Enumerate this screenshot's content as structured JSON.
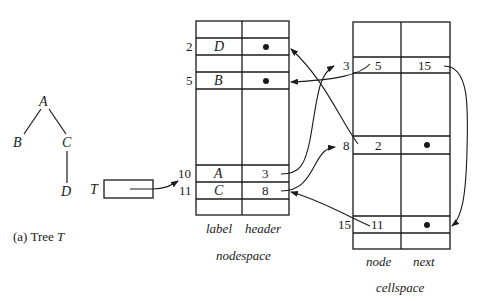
{
  "tree": {
    "caption": "(a)  Tree T",
    "caption_prefix": "(a)  Tree ",
    "caption_var": "T",
    "nodes": [
      {
        "label": "A",
        "x": 44,
        "y": 106
      },
      {
        "label": "B",
        "x": 19,
        "y": 147
      },
      {
        "label": "C",
        "x": 67,
        "y": 147
      },
      {
        "label": "D",
        "x": 66,
        "y": 195
      }
    ],
    "edges": [
      [
        "A",
        "B"
      ],
      [
        "A",
        "C"
      ],
      [
        "C",
        "D"
      ]
    ]
  },
  "pointer": {
    "label": "T",
    "target_index": "10"
  },
  "nodespace": {
    "title": "nodespace",
    "columns": [
      "label",
      "header"
    ],
    "rows": [
      {
        "index": "2",
        "label": "D",
        "header": "•"
      },
      {
        "index": "5",
        "label": "B",
        "header": "•"
      },
      {
        "index": "10",
        "label": "A",
        "header": "3"
      },
      {
        "index": "11",
        "label": "C",
        "header": "8"
      }
    ]
  },
  "cellspace": {
    "title": "cellspace",
    "columns": [
      "node",
      "next"
    ],
    "rows": [
      {
        "index": "3",
        "node": "5",
        "next": "15"
      },
      {
        "index": "8",
        "node": "2",
        "next": "•"
      },
      {
        "index": "15",
        "node": "11",
        "next": "•"
      }
    ]
  },
  "links": [
    {
      "from": "nodespace.10.header",
      "to": "cellspace.3"
    },
    {
      "from": "nodespace.11.header",
      "to": "cellspace.8"
    },
    {
      "from": "cellspace.3.node",
      "to": "nodespace.5"
    },
    {
      "from": "cellspace.8.node",
      "to": "nodespace.2"
    },
    {
      "from": "cellspace.15.node",
      "to": "nodespace.11"
    },
    {
      "from": "cellspace.3.next",
      "to": "cellspace.15"
    },
    {
      "from": "pointer.T",
      "to": "nodespace.10"
    }
  ]
}
